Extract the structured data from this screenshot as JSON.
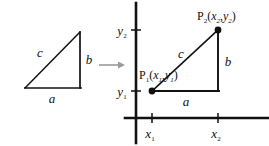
{
  "figure": {
    "type": "geometry-diagram",
    "title": "",
    "background_color": "#ffffff",
    "stroke_color": "#111111"
  },
  "left_triangle": {
    "name": "abstract-right-triangle",
    "labels": {
      "hypotenuse": "c",
      "vertical_leg": "b",
      "horizontal_leg": "a"
    },
    "vertices": {
      "bottom_left": [
        25,
        88
      ],
      "bottom_right": [
        80,
        88
      ],
      "top_right": [
        80,
        32
      ]
    }
  },
  "arrow": {
    "name": "maps-to-arrow",
    "glyph": "→",
    "color": "#9a9a9a",
    "from": [
      99,
      65
    ],
    "to": [
      124,
      65
    ]
  },
  "coordinate_plane": {
    "name": "cartesian-axes",
    "y_axis_x": 136,
    "x_axis_y": 118,
    "axis_ticks": {
      "y_labels": [
        "y_2",
        "y_1"
      ],
      "x_labels": [
        "x_1",
        "x_2"
      ]
    },
    "y2": {
      "base": "y",
      "subscript": "2",
      "pixel_y": 30
    },
    "y1": {
      "base": "y",
      "subscript": "1",
      "pixel_y": 91
    },
    "x1": {
      "base": "x",
      "subscript": "1",
      "pixel_x": 152
    },
    "x2": {
      "base": "x",
      "subscript": "2",
      "pixel_x": 218
    }
  },
  "right_triangle": {
    "name": "coordinate-right-triangle",
    "labels": {
      "hypotenuse": "c",
      "vertical_leg": "b",
      "horizontal_leg": "a"
    },
    "point_1": {
      "name": "P",
      "subscript": "1",
      "open_paren": "(",
      "coord_x_base": "x",
      "coord_x_sub": "1",
      "comma": ",",
      "coord_y_base": "y",
      "coord_y_sub": "1",
      "close_paren": ")",
      "full_text": "P1(x1,y1)",
      "pixel": [
        152,
        91
      ]
    },
    "point_2": {
      "name": "P",
      "subscript": "2",
      "open_paren": "(",
      "coord_x_base": "x",
      "coord_x_sub": "2",
      "comma": ",",
      "coord_y_base": "y",
      "coord_y_sub": "2",
      "close_paren": ")",
      "full_text": "P2(x2,y2)",
      "pixel": [
        218,
        30
      ]
    }
  }
}
